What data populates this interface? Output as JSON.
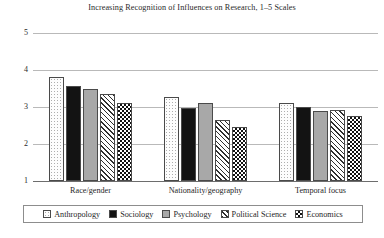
{
  "chart_data": {
    "type": "bar",
    "title": "Increasing Recognition of Influences on Research, 1–5 Scales",
    "xlabel": "",
    "ylabel": "",
    "ylim": [
      1,
      5
    ],
    "yticks": [
      "1",
      "2",
      "3",
      "4",
      "5"
    ],
    "grid": true,
    "legend_position": "bottom",
    "categories": [
      "Race/gender",
      "Nationality/geography",
      "Temporal focus"
    ],
    "series": [
      {
        "name": "Anthropology",
        "pattern": "dotted",
        "values": [
          3.82,
          3.27,
          3.1
        ]
      },
      {
        "name": "Sociology",
        "pattern": "solid-black",
        "values": [
          3.58,
          2.97,
          3.0
        ]
      },
      {
        "name": "Psychology",
        "pattern": "solid-gray",
        "values": [
          3.5,
          3.1,
          2.9
        ]
      },
      {
        "name": "Political Science",
        "pattern": "diagonal",
        "values": [
          3.35,
          2.65,
          2.92
        ]
      },
      {
        "name": "Economics",
        "pattern": "checker",
        "values": [
          3.1,
          2.46,
          2.75
        ]
      }
    ]
  },
  "legend": {
    "items": [
      {
        "label": "Anthropology"
      },
      {
        "label": "Sociology"
      },
      {
        "label": "Psychology"
      },
      {
        "label": "Political Science"
      },
      {
        "label": "Economics"
      }
    ]
  }
}
